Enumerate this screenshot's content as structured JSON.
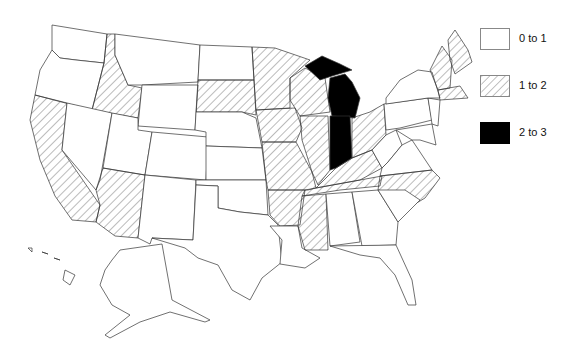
{
  "legend": {
    "items": [
      {
        "label": "0 to 1",
        "fill": "none"
      },
      {
        "label": "1 to 2",
        "fill": "hatched"
      },
      {
        "label": "2 to 3",
        "fill": "solid-black"
      }
    ]
  },
  "map": {
    "region": "United States",
    "categories": {
      "0 to 1": [
        "Washington",
        "Oregon",
        "Nevada",
        "Montana",
        "Wyoming",
        "Utah",
        "Colorado",
        "New Mexico",
        "North Dakota",
        "Nebraska",
        "Kansas",
        "Oklahoma",
        "Texas",
        "Louisiana",
        "Alabama",
        "Georgia",
        "South Carolina",
        "Florida",
        "Kentucky",
        "Virginia",
        "West Virginia",
        "Pennsylvania",
        "New York",
        "New Jersey",
        "Delaware",
        "Maryland",
        "Alaska",
        "Hawaii"
      ],
      "1 to 2": [
        "California",
        "Idaho",
        "Arizona",
        "South Dakota",
        "Minnesota",
        "Iowa",
        "Missouri",
        "Arkansas",
        "Mississippi",
        "Tennessee",
        "North Carolina",
        "Wisconsin",
        "Illinois",
        "Ohio",
        "Maine",
        "New Hampshire",
        "Vermont",
        "Massachusetts",
        "Connecticut",
        "Rhode Island"
      ],
      "2 to 3": [
        "Michigan",
        "Indiana"
      ]
    }
  },
  "colors": {
    "hatched": "#555555",
    "solid": "#000000",
    "stroke": "#333333"
  }
}
